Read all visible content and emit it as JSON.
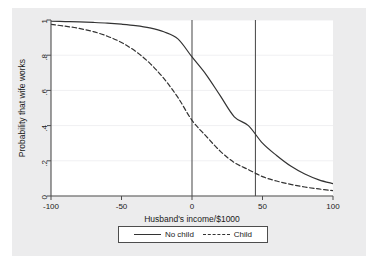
{
  "chart_data": {
    "type": "line",
    "title": "",
    "xlabel": "Husband's income/$1000",
    "ylabel": "Probability that wife works",
    "xlim": [
      -100,
      100
    ],
    "ylim": [
      0,
      1
    ],
    "xticks": [
      -100,
      -50,
      0,
      50,
      100
    ],
    "xtick_labels": [
      "-100",
      "-50",
      "0",
      "50",
      "100"
    ],
    "yticks": [
      0,
      0.2,
      0.4,
      0.6,
      0.8,
      1
    ],
    "ytick_labels": [
      "0",
      ".2",
      ".4",
      ".6",
      ".8",
      "1"
    ],
    "grid": "horizontal",
    "legend_position": "below-center",
    "series": [
      {
        "name": "No child",
        "style": "solid",
        "color": "#333333",
        "x": [
          -100,
          -90,
          -80,
          -70,
          -60,
          -50,
          -40,
          -30,
          -20,
          -10,
          0,
          10,
          20,
          30,
          40,
          50,
          60,
          70,
          80,
          90,
          100
        ],
        "values": [
          0.993,
          0.991,
          0.989,
          0.986,
          0.982,
          0.976,
          0.968,
          0.955,
          0.933,
          0.893,
          0.79,
          0.69,
          0.57,
          0.45,
          0.4,
          0.3,
          0.23,
          0.17,
          0.125,
          0.092,
          0.07
        ]
      },
      {
        "name": "Child",
        "style": "dashed",
        "color": "#333333",
        "x": [
          -100,
          -90,
          -80,
          -70,
          -60,
          -50,
          -40,
          -30,
          -20,
          -10,
          0,
          10,
          20,
          30,
          40,
          50,
          60,
          70,
          80,
          90,
          100
        ],
        "values": [
          0.975,
          0.965,
          0.952,
          0.934,
          0.908,
          0.872,
          0.822,
          0.755,
          0.668,
          0.56,
          0.43,
          0.34,
          0.255,
          0.19,
          0.15,
          0.11,
          0.085,
          0.066,
          0.051,
          0.04,
          0.03
        ]
      }
    ],
    "reference_lines": [
      {
        "name": "vline-zero",
        "x": 0,
        "orientation": "vertical",
        "color": "#555555"
      },
      {
        "name": "vline-45",
        "x": 45,
        "orientation": "vertical",
        "color": "#555555"
      }
    ],
    "annotations": []
  },
  "legend": {
    "entries": [
      {
        "label": "No child",
        "style": "solid"
      },
      {
        "label": "Child",
        "style": "dashed"
      }
    ]
  },
  "colors": {
    "outer_background": "#ececed",
    "plot_background": "#ffffff",
    "axis": "#4d4d4d",
    "grid": "#f0f0f2",
    "curve": "#333333",
    "reference_line": "#555555",
    "text": "#1a1a1a"
  }
}
